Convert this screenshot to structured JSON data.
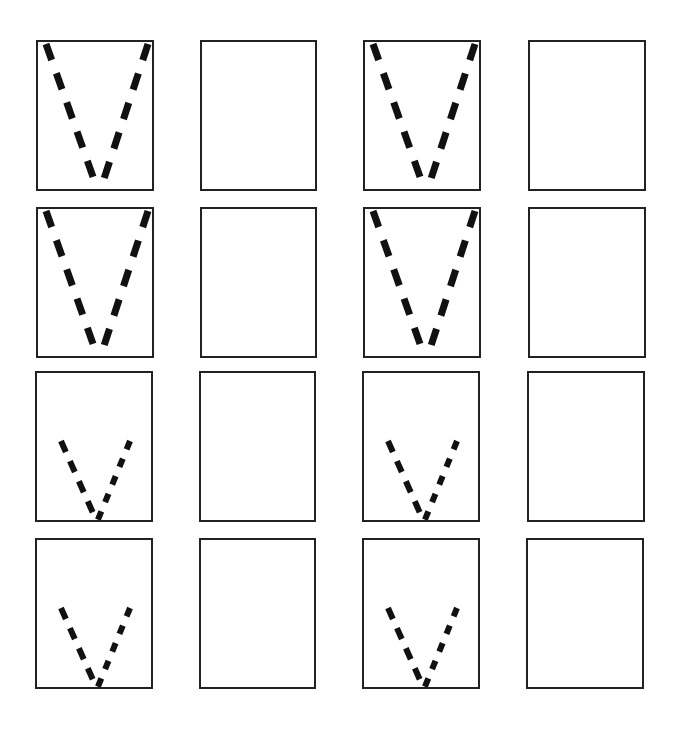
{
  "figure": {
    "background": "#ffffff",
    "stroke_color": "#111111",
    "border_color": "#222222",
    "panels": [
      {
        "row": 1,
        "col": 1,
        "x": 36,
        "y": 40,
        "w": 118,
        "h": 151,
        "content": "dashed-v",
        "size": "large"
      },
      {
        "row": 1,
        "col": 2,
        "x": 200,
        "y": 40,
        "w": 117,
        "h": 151,
        "content": "empty"
      },
      {
        "row": 1,
        "col": 3,
        "x": 363,
        "y": 40,
        "w": 118,
        "h": 151,
        "content": "dashed-v",
        "size": "large"
      },
      {
        "row": 1,
        "col": 4,
        "x": 528,
        "y": 40,
        "w": 118,
        "h": 151,
        "content": "empty"
      },
      {
        "row": 2,
        "col": 1,
        "x": 36,
        "y": 207,
        "w": 118,
        "h": 151,
        "content": "dashed-v",
        "size": "large"
      },
      {
        "row": 2,
        "col": 2,
        "x": 200,
        "y": 207,
        "w": 117,
        "h": 151,
        "content": "empty"
      },
      {
        "row": 2,
        "col": 3,
        "x": 363,
        "y": 207,
        "w": 118,
        "h": 151,
        "content": "dashed-v",
        "size": "large"
      },
      {
        "row": 2,
        "col": 4,
        "x": 528,
        "y": 207,
        "w": 118,
        "h": 151,
        "content": "empty"
      },
      {
        "row": 3,
        "col": 1,
        "x": 35,
        "y": 371,
        "w": 118,
        "h": 151,
        "content": "dashed-v",
        "size": "small"
      },
      {
        "row": 3,
        "col": 2,
        "x": 199,
        "y": 371,
        "w": 117,
        "h": 151,
        "content": "empty"
      },
      {
        "row": 3,
        "col": 3,
        "x": 362,
        "y": 371,
        "w": 118,
        "h": 151,
        "content": "dashed-v",
        "size": "small"
      },
      {
        "row": 3,
        "col": 4,
        "x": 527,
        "y": 371,
        "w": 118,
        "h": 151,
        "content": "empty"
      },
      {
        "row": 4,
        "col": 1,
        "x": 35,
        "y": 538,
        "w": 118,
        "h": 151,
        "content": "dashed-v",
        "size": "small"
      },
      {
        "row": 4,
        "col": 2,
        "x": 199,
        "y": 538,
        "w": 117,
        "h": 151,
        "content": "empty"
      },
      {
        "row": 4,
        "col": 3,
        "x": 362,
        "y": 538,
        "w": 118,
        "h": 151,
        "content": "dashed-v",
        "size": "small"
      },
      {
        "row": 4,
        "col": 4,
        "x": 526,
        "y": 538,
        "w": 118,
        "h": 151,
        "content": "empty"
      }
    ],
    "v_shapes": {
      "large": {
        "left_arm": {
          "x1": 8,
          "y1": 2,
          "x2": 60,
          "y2": 149,
          "stroke_width": 7,
          "dash": "17 14"
        },
        "right_arm": {
          "x1": 110,
          "y1": 2,
          "x2": 62,
          "y2": 149,
          "stroke_width": 7,
          "dash": "17 14"
        }
      },
      "small": {
        "left_arm": {
          "x1": 24,
          "y1": 68,
          "x2": 60,
          "y2": 149,
          "stroke_width": 6,
          "dash": "12 10"
        },
        "right_arm": {
          "x1": 93,
          "y1": 68,
          "x2": 60,
          "y2": 149,
          "stroke_width": 6,
          "dash": "9 10"
        }
      }
    }
  }
}
